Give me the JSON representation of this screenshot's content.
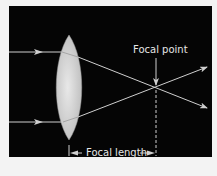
{
  "diagram": {
    "labels": {
      "focal_point": "Focal point",
      "focal_length": "Focal length"
    },
    "colors": {
      "background": "#050505",
      "rays": "#cfcfcf",
      "lens": "#d9d9d9",
      "text": "#e6e6e6"
    },
    "elements": [
      "incoming-ray-top",
      "incoming-ray-bottom",
      "convex-lens",
      "refracted-ray-top",
      "refracted-ray-bottom",
      "focal-point-arrow",
      "focal-length-dimension"
    ]
  }
}
